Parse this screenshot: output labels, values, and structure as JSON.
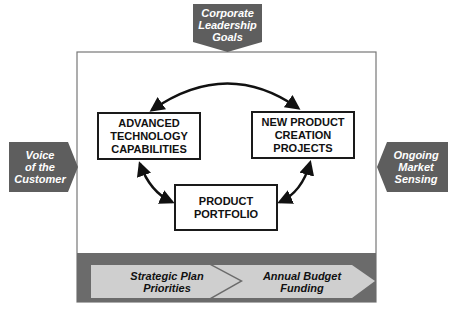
{
  "diagram": {
    "inputs": {
      "top": {
        "label": "Corporate\nLeadership\nGoals",
        "direction": "down"
      },
      "left": {
        "label": "Voice\nof the\nCustomer",
        "direction": "right"
      },
      "right": {
        "label": "Ongoing\nMarket\nSensing",
        "direction": "left"
      }
    },
    "nodes": [
      {
        "id": "advanced-technology",
        "label": "ADVANCED\nTECHNOLOGY\nCAPABILITIES"
      },
      {
        "id": "new-product",
        "label": "NEW PRODUCT\nCREATION\nPROJECTS"
      },
      {
        "id": "product-portfolio",
        "label": "PRODUCT\nPORTFOLIO"
      }
    ],
    "edges": [
      {
        "from": "advanced-technology",
        "to": "new-product",
        "type": "bidirectional"
      },
      {
        "from": "advanced-technology",
        "to": "product-portfolio",
        "type": "bidirectional"
      },
      {
        "from": "new-product",
        "to": "product-portfolio",
        "type": "bidirectional"
      }
    ],
    "band": {
      "steps": [
        {
          "label": "Strategic Plan\nPriorities"
        },
        {
          "label": "Annual Budget\nFunding"
        }
      ]
    },
    "colors": {
      "tag_fill": "#5e5e5e",
      "band_fill": "#6b6b6b",
      "chevron_fill": "#cfcfcf",
      "frame_stroke": "#777777",
      "box_stroke": "#1a1a1a"
    }
  }
}
